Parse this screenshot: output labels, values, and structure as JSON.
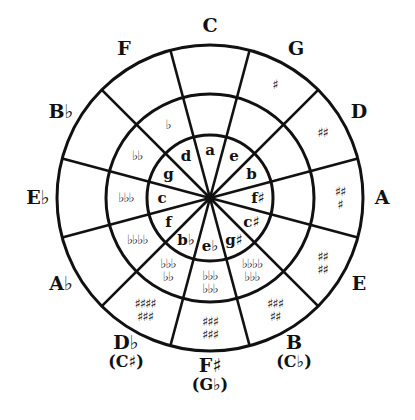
{
  "diagram": {
    "ink_color": "#111111",
    "background": "#ffffff",
    "geometry": {
      "cx": 210,
      "cy": 198,
      "outer_r": 153,
      "middle_r": 104,
      "inner_r": 63
    },
    "segments": [
      {
        "major": "C",
        "alt": "",
        "minor": "a",
        "middle_acc": [],
        "outer_acc": []
      },
      {
        "major": "G",
        "alt": "",
        "minor": "e",
        "middle_acc": [],
        "outer_acc": [
          "♯"
        ]
      },
      {
        "major": "D",
        "alt": "",
        "minor": "b",
        "middle_acc": [],
        "outer_acc": [
          "♯♯"
        ]
      },
      {
        "major": "A",
        "alt": "",
        "minor": "f♯",
        "middle_acc": [],
        "outer_acc": [
          "♯♯",
          "♯"
        ]
      },
      {
        "major": "E",
        "alt": "",
        "minor": "c♯",
        "middle_acc": [],
        "outer_acc": [
          "♯♯",
          "♯♯"
        ]
      },
      {
        "major": "B",
        "alt": "(C♭)",
        "minor": "g♯",
        "middle_acc": [
          "♭♭♭♭",
          "♭♭♭"
        ],
        "outer_acc": [
          "♯♯♯",
          "♯♯"
        ]
      },
      {
        "major": "F♯",
        "alt": "(G♭)",
        "minor": "e♭",
        "middle_acc": [
          "♭♭♭",
          "♭♭♭"
        ],
        "outer_acc": [
          "♯♯♯",
          "♯♯♯"
        ]
      },
      {
        "major": "D♭",
        "alt": "(C♯)",
        "minor": "b♭",
        "middle_acc": [
          "♭♭♭",
          "♭♭"
        ],
        "outer_acc": [
          "♯♯♯♯",
          "♯♯♯"
        ]
      },
      {
        "major": "A♭",
        "alt": "",
        "minor": "f",
        "middle_acc": [
          "♭♭♭♭"
        ],
        "outer_acc": []
      },
      {
        "major": "E♭",
        "alt": "",
        "minor": "c",
        "middle_acc": [
          "♭♭♭"
        ],
        "outer_acc": []
      },
      {
        "major": "B♭",
        "alt": "",
        "minor": "g",
        "middle_acc": [
          "♭♭"
        ],
        "outer_acc": []
      },
      {
        "major": "F",
        "alt": "",
        "minor": "d",
        "middle_acc": [
          "♭"
        ],
        "outer_acc": []
      }
    ]
  }
}
